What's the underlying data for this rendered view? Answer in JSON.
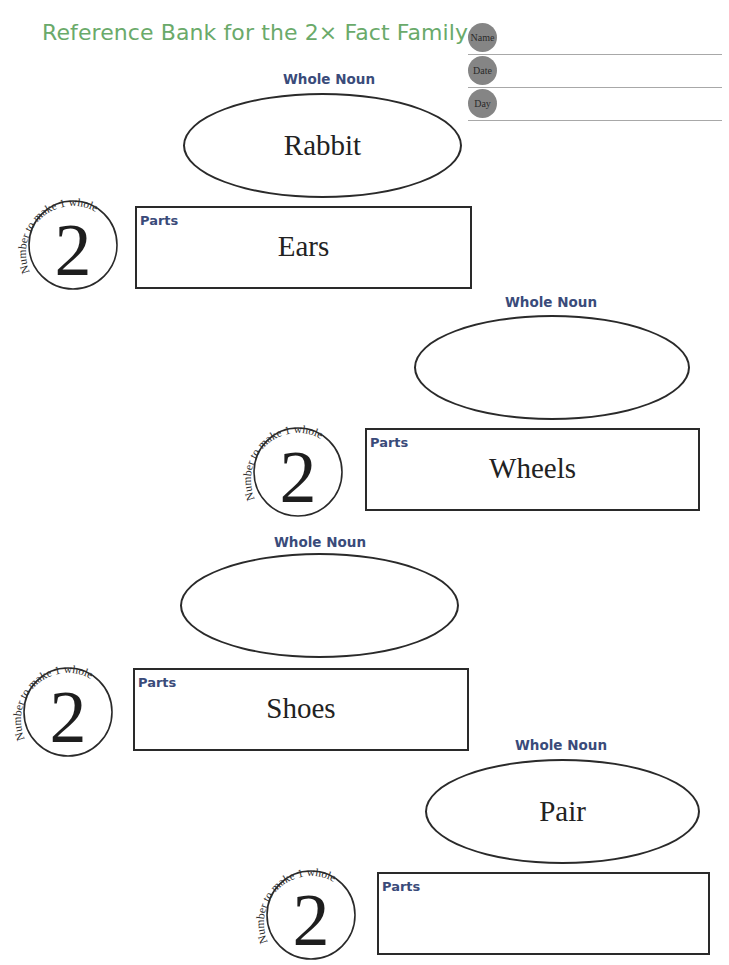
{
  "title": "Reference Bank for the 2× Fact Family",
  "header_fields": [
    {
      "label": "Name",
      "value": ""
    },
    {
      "label": "Date",
      "value": ""
    },
    {
      "label": "Day",
      "value": ""
    }
  ],
  "blocks": [
    {
      "whole_noun_label": "Whole Noun",
      "whole_noun": "Rabbit",
      "circle_caption": "Number to make 1 whole",
      "number": "2",
      "parts_label": "Parts",
      "parts": "Ears"
    },
    {
      "whole_noun_label": "Whole Noun",
      "whole_noun": "",
      "circle_caption": "Number to make 1 whole",
      "number": "2",
      "parts_label": "Parts",
      "parts": "Wheels"
    },
    {
      "whole_noun_label": "Whole Noun",
      "whole_noun": "",
      "circle_caption": "Number to make 1 whole",
      "number": "2",
      "parts_label": "Parts",
      "parts": "Shoes"
    },
    {
      "whole_noun_label": "Whole Noun",
      "whole_noun": "Pair",
      "circle_caption": "Number to make 1 whole",
      "number": "2",
      "parts_label": "Parts",
      "parts": ""
    }
  ],
  "colors": {
    "title": "#6aaa6a",
    "label": "#3a4b7a",
    "dot": "#858585"
  }
}
